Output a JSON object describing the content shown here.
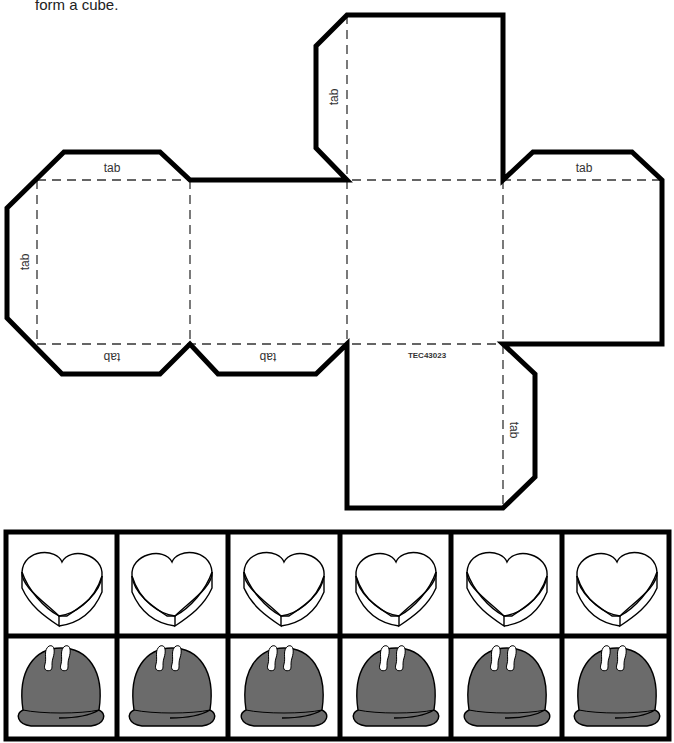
{
  "worksheet": {
    "instructions": "form a cube.",
    "product_code": "TEC43023",
    "tab_label": "tab",
    "colors": {
      "outline": "#000000",
      "fold_line": "#333333",
      "chocolate_fill": "#6b6b6b",
      "heart_fill": "#ffffff"
    }
  },
  "cube_net": {
    "faces": [
      {
        "id": "top",
        "label": ""
      },
      {
        "id": "left",
        "label": ""
      },
      {
        "id": "middle-left",
        "label": ""
      },
      {
        "id": "center",
        "label": ""
      },
      {
        "id": "right",
        "label": ""
      },
      {
        "id": "bottom",
        "label": "TEC43023"
      }
    ],
    "tabs": [
      {
        "face": "top",
        "side": "left",
        "label": "tab"
      },
      {
        "face": "left",
        "side": "top",
        "label": "tab"
      },
      {
        "face": "left",
        "side": "left",
        "label": "tab"
      },
      {
        "face": "left",
        "side": "bottom",
        "label": "tab"
      },
      {
        "face": "middle-left",
        "side": "bottom",
        "label": "tab"
      },
      {
        "face": "right",
        "side": "top",
        "label": "tab"
      },
      {
        "face": "bottom",
        "side": "right",
        "label": "tab"
      }
    ]
  },
  "picture_cards": {
    "rows": [
      {
        "item": "heart-candy-box",
        "count": 6
      },
      {
        "item": "chocolate-bonbon",
        "count": 6
      }
    ]
  }
}
